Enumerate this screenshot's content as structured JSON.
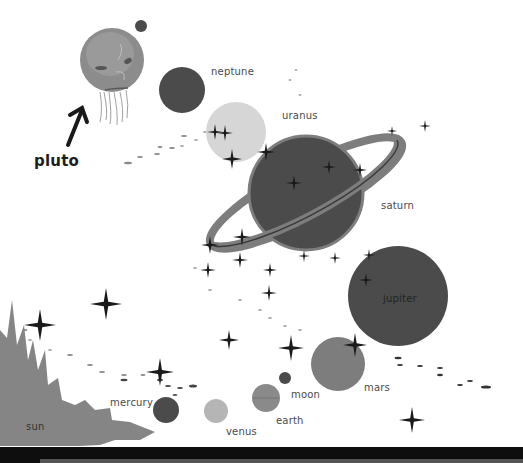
{
  "colors": {
    "background": "#ffffff",
    "dark_planet": "#4b4b4b",
    "mid_planet": "#7d7d7d",
    "light_planet": "#b5b5b5",
    "pale_planet": "#d6d6d6",
    "star": "#1a1a1a",
    "bottom_bar": "#0e0e0e"
  },
  "labels": {
    "pluto": "pluto",
    "neptune": "neptune",
    "uranus": "uranus",
    "saturn": "saturn",
    "jupiter": "jupiter",
    "mars": "mars",
    "moon": "moon",
    "earth": "earth",
    "venus": "venus",
    "mercury": "mercury",
    "sun": "sun"
  },
  "bodies": [
    {
      "name": "pluto",
      "cx": 112,
      "cy": 60,
      "r": 32
    },
    {
      "name": "pluto-moon",
      "cx": 141,
      "cy": 26,
      "r": 6
    },
    {
      "name": "neptune",
      "cx": 182,
      "cy": 90,
      "r": 23
    },
    {
      "name": "uranus",
      "cx": 236,
      "cy": 132,
      "r": 30
    },
    {
      "name": "saturn",
      "cx": 306,
      "cy": 193,
      "r": 57
    },
    {
      "name": "jupiter",
      "cx": 398,
      "cy": 296,
      "r": 50
    },
    {
      "name": "mars",
      "cx": 338,
      "cy": 364,
      "r": 27
    },
    {
      "name": "moon",
      "cx": 285,
      "cy": 378,
      "r": 6
    },
    {
      "name": "earth",
      "cx": 266,
      "cy": 398,
      "r": 14
    },
    {
      "name": "venus",
      "cx": 216,
      "cy": 411,
      "r": 12
    },
    {
      "name": "mercury",
      "cx": 166,
      "cy": 410,
      "r": 13
    }
  ]
}
